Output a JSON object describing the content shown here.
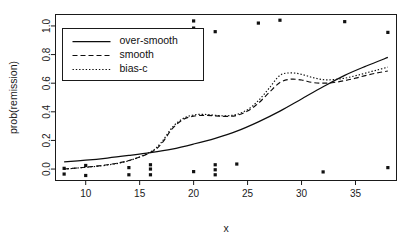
{
  "chart_data": {
    "type": "line",
    "title": "",
    "xlabel": "x",
    "ylabel": "prob(remission)",
    "xlim": [
      7.2,
      38.8
    ],
    "ylim": [
      -0.08,
      1.08
    ],
    "grid": false,
    "legend_position": "top-left",
    "xticks": [
      10,
      15,
      20,
      25,
      30,
      35
    ],
    "xtick_labels": [
      "10",
      "15",
      "20",
      "25",
      "30",
      "35"
    ],
    "yticks": [
      0.0,
      0.2,
      0.4,
      0.6,
      0.8,
      1.0
    ],
    "ytick_labels": [
      "0.0",
      "0.2",
      "0.4",
      "0.6",
      "0.8",
      "1.0"
    ],
    "series": [
      {
        "name": "over-smooth",
        "style": "solid",
        "x": [
          8,
          10,
          12,
          14,
          16,
          18,
          20,
          22,
          24,
          26,
          28,
          30,
          32,
          34,
          36,
          38
        ],
        "values": [
          0.05,
          0.062,
          0.077,
          0.095,
          0.115,
          0.14,
          0.175,
          0.215,
          0.265,
          0.33,
          0.405,
          0.49,
          0.575,
          0.655,
          0.72,
          0.78
        ]
      },
      {
        "name": "smooth",
        "style": "dashed",
        "x": [
          8,
          10,
          12,
          14,
          16,
          17,
          18,
          19,
          20,
          21,
          22,
          23,
          24,
          25,
          26,
          27,
          28,
          29,
          30,
          31,
          32,
          33,
          34,
          35,
          36,
          37,
          38
        ],
        "values": [
          0.0,
          0.013,
          0.03,
          0.06,
          0.115,
          0.175,
          0.28,
          0.345,
          0.37,
          0.375,
          0.372,
          0.368,
          0.375,
          0.405,
          0.46,
          0.535,
          0.605,
          0.628,
          0.622,
          0.605,
          0.6,
          0.605,
          0.618,
          0.635,
          0.655,
          0.672,
          0.685
        ]
      },
      {
        "name": "bias-c",
        "style": "dotted",
        "x": [
          8,
          10,
          12,
          14,
          16,
          17,
          18,
          19,
          20,
          21,
          22,
          23,
          24,
          25,
          26,
          27,
          28,
          29,
          30,
          31,
          32,
          33,
          34,
          35,
          36,
          37,
          38
        ],
        "values": [
          0.0,
          0.012,
          0.028,
          0.058,
          0.12,
          0.185,
          0.29,
          0.352,
          0.378,
          0.382,
          0.376,
          0.372,
          0.382,
          0.415,
          0.478,
          0.565,
          0.655,
          0.672,
          0.662,
          0.64,
          0.625,
          0.625,
          0.635,
          0.652,
          0.672,
          0.692,
          0.712
        ]
      }
    ],
    "scatter": {
      "name": "observations",
      "marker": "square",
      "points": [
        {
          "x": 8.0,
          "y": 0.005
        },
        {
          "x": 8.0,
          "y": -0.035
        },
        {
          "x": 10.0,
          "y": 0.025
        },
        {
          "x": 10.0,
          "y": -0.045
        },
        {
          "x": 14.0,
          "y": 0.01
        },
        {
          "x": 14.0,
          "y": -0.04
        },
        {
          "x": 16.0,
          "y": 0.03
        },
        {
          "x": 16.0,
          "y": 0.0
        },
        {
          "x": 16.0,
          "y": -0.04
        },
        {
          "x": 18.0,
          "y": 0.955
        },
        {
          "x": 20.0,
          "y": 1.035
        },
        {
          "x": 20.0,
          "y": 0.985
        },
        {
          "x": 20.0,
          "y": -0.018
        },
        {
          "x": 22.0,
          "y": 0.03
        },
        {
          "x": 22.0,
          "y": -0.005
        },
        {
          "x": 22.0,
          "y": -0.04
        },
        {
          "x": 22.0,
          "y": 0.96
        },
        {
          "x": 24.0,
          "y": 0.035
        },
        {
          "x": 26.0,
          "y": 1.02
        },
        {
          "x": 28.0,
          "y": 1.04
        },
        {
          "x": 32.0,
          "y": -0.02
        },
        {
          "x": 34.0,
          "y": 1.03
        },
        {
          "x": 38.0,
          "y": 0.955
        },
        {
          "x": 38.0,
          "y": 0.01
        }
      ]
    },
    "legend_entries": [
      "over-smooth",
      "smooth",
      "bias-c"
    ]
  },
  "colors": {
    "foreground": "#111111",
    "axis": "#1a1a1a",
    "background": "#ffffff"
  }
}
